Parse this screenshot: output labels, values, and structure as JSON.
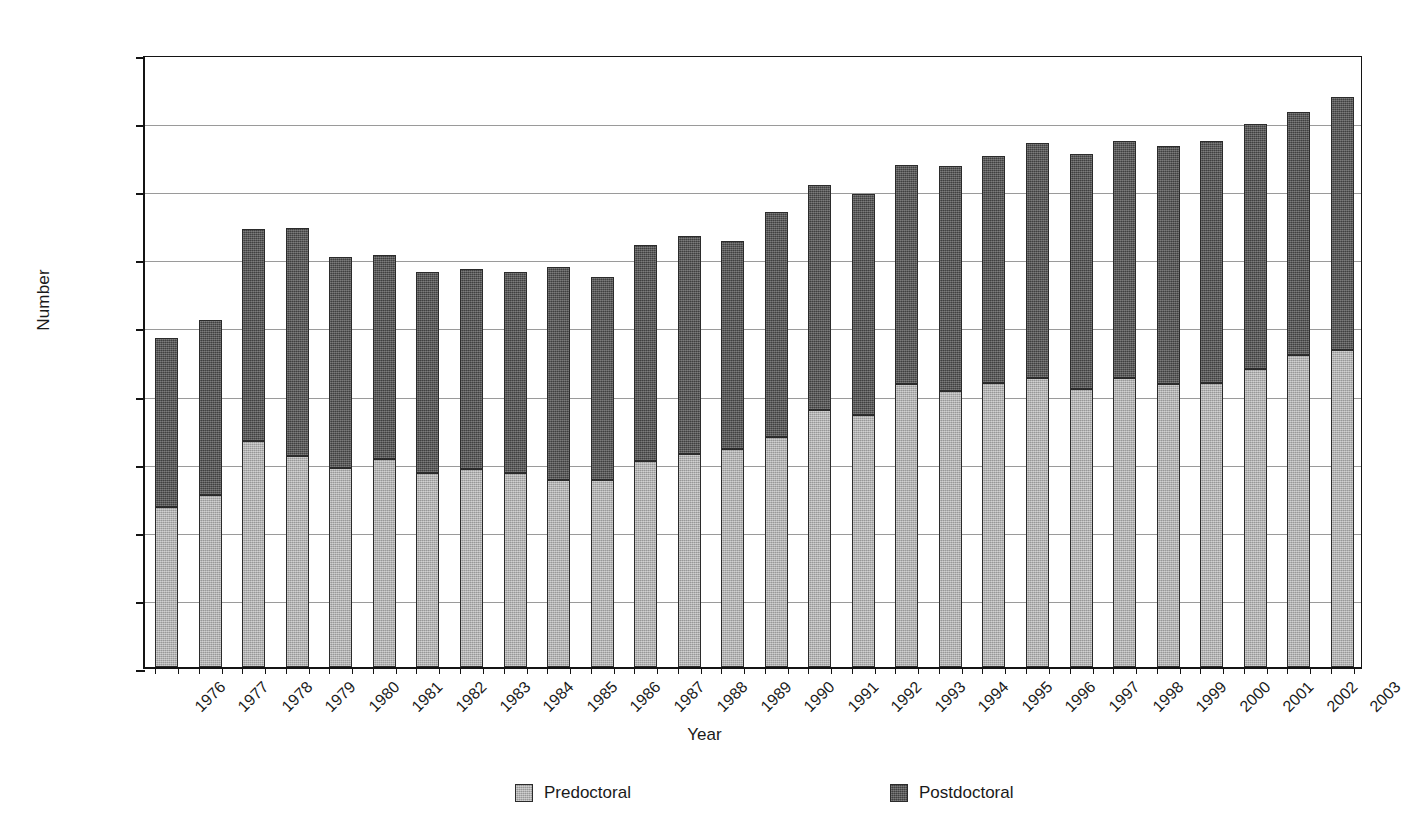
{
  "chart_data": {
    "type": "bar",
    "stacked": true,
    "title": "",
    "xlabel": "Year",
    "ylabel": "Number",
    "ylim": [
      0,
      18000
    ],
    "ytick_labels": [
      "0",
      "2000",
      "4000",
      "6000",
      "8000",
      "10000",
      "12000",
      "14000",
      "16000",
      "18000"
    ],
    "ytick_values": [
      0,
      2000,
      4000,
      6000,
      8000,
      10000,
      12000,
      14000,
      16000,
      18000
    ],
    "grid": true,
    "legend_position": "bottom",
    "categories": [
      "1976",
      "1977",
      "1978",
      "1979",
      "1980",
      "1981",
      "1982",
      "1983",
      "1984",
      "1985",
      "1986",
      "1987",
      "1988",
      "1989",
      "1990",
      "1991",
      "1992",
      "1993",
      "1994",
      "1995",
      "1996",
      "1997",
      "1998",
      "1999",
      "2000",
      "2001",
      "2002",
      "2003"
    ],
    "series": [
      {
        "name": "Predoctoral",
        "color": "#a9a9a9",
        "values": [
          4700,
          5050,
          6650,
          6200,
          5850,
          6100,
          5700,
          5800,
          5700,
          5500,
          5500,
          6050,
          6250,
          6400,
          6750,
          7550,
          7400,
          8300,
          8100,
          8350,
          8500,
          8150,
          8500,
          8300,
          8350,
          8750,
          9150,
          9300
        ]
      },
      {
        "name": "Postdoctoral",
        "color": "#4d4d4d",
        "values": [
          4950,
          5150,
          6200,
          6700,
          6200,
          6000,
          5900,
          5900,
          5900,
          6250,
          5950,
          6350,
          6400,
          6100,
          6600,
          6600,
          6500,
          6450,
          6600,
          6650,
          6900,
          6900,
          6950,
          7000,
          7100,
          7200,
          7150,
          7450
        ]
      }
    ],
    "totals": [
      9650,
      10200,
      12850,
      12900,
      12050,
      12100,
      11600,
      11700,
      11600,
      11750,
      11450,
      12400,
      12650,
      12500,
      13350,
      14150,
      13900,
      14750,
      14700,
      15000,
      15400,
      15050,
      15450,
      15300,
      15450,
      15950,
      16300,
      16750
    ]
  },
  "legend": {
    "entries": [
      {
        "label": "Predoctoral",
        "color": "#a9a9a9"
      },
      {
        "label": "Postdoctoral",
        "color": "#4d4d4d"
      }
    ]
  }
}
